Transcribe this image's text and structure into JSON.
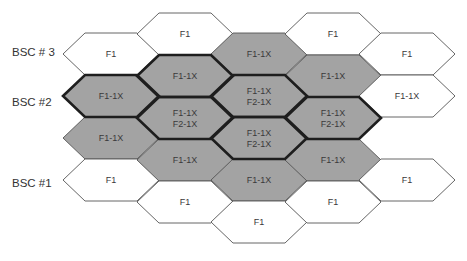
{
  "diagram": {
    "type": "hexagonal-cell-layout",
    "colors": {
      "shaded": "#a3a3a3",
      "plain": "#ffffff",
      "stroke": "#555555",
      "heavy_stroke": "#1e1e1e",
      "text": "#3a3a3a"
    },
    "bsc_labels": [
      {
        "label": "BSC # 3",
        "x": 12,
        "y": 56
      },
      {
        "label": "BSC #2",
        "x": 12,
        "y": 106
      },
      {
        "label": "BSC #1",
        "x": 12,
        "y": 187
      }
    ],
    "cells": [
      {
        "col": 0,
        "top": 33,
        "lines": [
          "F1"
        ],
        "shaded": false,
        "heavy": false
      },
      {
        "col": 0,
        "top": 75,
        "lines": [
          "F1-1X"
        ],
        "shaded": true,
        "heavy": true
      },
      {
        "col": 0,
        "top": 117,
        "lines": [
          "F1-1X"
        ],
        "shaded": true,
        "heavy": false
      },
      {
        "col": 0,
        "top": 159,
        "lines": [
          "F1"
        ],
        "shaded": false,
        "heavy": false
      },
      {
        "col": 1,
        "top": 13,
        "lines": [
          "F1"
        ],
        "shaded": false,
        "heavy": false
      },
      {
        "col": 1,
        "top": 55,
        "lines": [
          "F1-1X"
        ],
        "shaded": true,
        "heavy": true
      },
      {
        "col": 1,
        "top": 97,
        "lines": [
          "F1-1X",
          "F2-1X"
        ],
        "shaded": true,
        "heavy": true
      },
      {
        "col": 1,
        "top": 139,
        "lines": [
          "F1-1X"
        ],
        "shaded": true,
        "heavy": false
      },
      {
        "col": 1,
        "top": 181,
        "lines": [
          "F1"
        ],
        "shaded": false,
        "heavy": false
      },
      {
        "col": 2,
        "top": 33,
        "lines": [
          "F1-1X"
        ],
        "shaded": true,
        "heavy": false
      },
      {
        "col": 2,
        "top": 75,
        "lines": [
          "F1-1X",
          "F2-1X"
        ],
        "shaded": true,
        "heavy": true
      },
      {
        "col": 2,
        "top": 117,
        "lines": [
          "F1-1X",
          "F2-1X"
        ],
        "shaded": true,
        "heavy": true
      },
      {
        "col": 2,
        "top": 159,
        "lines": [
          "F1-1X"
        ],
        "shaded": true,
        "heavy": false
      },
      {
        "col": 2,
        "top": 201,
        "lines": [
          "F1"
        ],
        "shaded": false,
        "heavy": false
      },
      {
        "col": 3,
        "top": 13,
        "lines": [
          "F1"
        ],
        "shaded": false,
        "heavy": false
      },
      {
        "col": 3,
        "top": 55,
        "lines": [
          "F1-1X"
        ],
        "shaded": true,
        "heavy": false
      },
      {
        "col": 3,
        "top": 97,
        "lines": [
          "F1-1X",
          "F2-1X"
        ],
        "shaded": true,
        "heavy": true
      },
      {
        "col": 3,
        "top": 139,
        "lines": [
          "F1-1X"
        ],
        "shaded": true,
        "heavy": false
      },
      {
        "col": 3,
        "top": 181,
        "lines": [
          "F1"
        ],
        "shaded": false,
        "heavy": false
      },
      {
        "col": 4,
        "top": 33,
        "lines": [
          "F1"
        ],
        "shaded": false,
        "heavy": false
      },
      {
        "col": 4,
        "top": 75,
        "lines": [
          "F1-1X"
        ],
        "shaded": false,
        "heavy": false
      },
      {
        "col": 4,
        "top": 159,
        "lines": [
          "F1"
        ],
        "shaded": false,
        "heavy": false
      }
    ],
    "geometry": {
      "col_left_x": [
        63,
        137,
        211,
        285,
        359
      ],
      "hex_width": 96,
      "hex_inset": 22,
      "hex_height": 42
    }
  }
}
